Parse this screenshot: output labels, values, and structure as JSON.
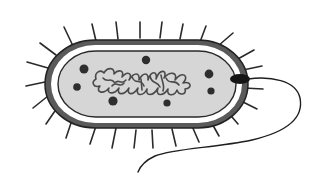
{
  "diagram": {
    "labels": [],
    "colors": {
      "background": "#ffffff",
      "outline": "#2a2a2a",
      "cell_wall_fill": "#5a5a5a",
      "periplasm_gap": "#ffffff",
      "cytoplasm": "#d6d6d6",
      "nucleoid_stroke": "#4a4a4a",
      "ribosome": "#2e2e2e",
      "flagellum": "#1e1e1e"
    },
    "parts": [
      {
        "name": "pili",
        "count": 30
      },
      {
        "name": "cell-wall"
      },
      {
        "name": "cell-membrane"
      },
      {
        "name": "cytoplasm"
      },
      {
        "name": "nucleoid"
      },
      {
        "name": "ribosomes",
        "count": 7
      },
      {
        "name": "flagellum"
      }
    ]
  }
}
